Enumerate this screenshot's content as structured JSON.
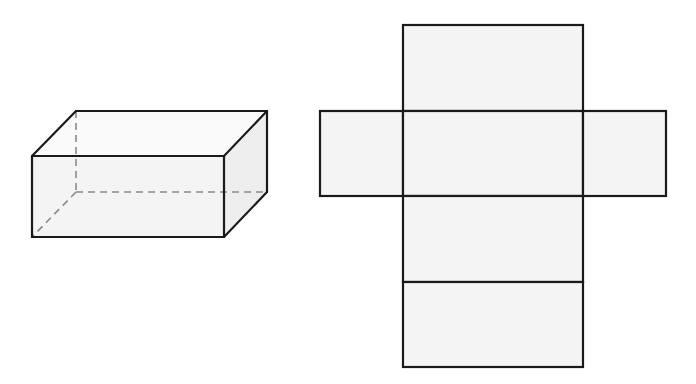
{
  "colors": {
    "background": "#ffffff",
    "edge": "#1a1a1a",
    "hidden_edge": "#8a8a8a",
    "face_fill": "#f4f4f4",
    "side_fill": "#eeeeee"
  },
  "figure": {
    "left": {
      "description": "Rectangular prism (cuboid) in oblique projection with hidden edges dashed",
      "vertices": {
        "front_top_left": [
          32,
          156
        ],
        "front_top_right": [
          224,
          156
        ],
        "front_bottom_left": [
          32,
          237
        ],
        "front_bottom_right": [
          224,
          237
        ],
        "back_top_left": [
          76,
          111
        ],
        "back_top_right": [
          267,
          111
        ],
        "back_bottom_right": [
          267,
          192
        ],
        "back_bottom_left_hidden": [
          76,
          192
        ]
      }
    },
    "right": {
      "description": "Net of the rectangular prism (cross-shaped unfolding, 6 faces)",
      "faces": [
        {
          "name": "top-face",
          "x": 403,
          "y": 25,
          "w": 180,
          "h": 86
        },
        {
          "name": "left-face",
          "x": 320,
          "y": 111,
          "w": 83,
          "h": 85
        },
        {
          "name": "center-face",
          "x": 403,
          "y": 111,
          "w": 180,
          "h": 85
        },
        {
          "name": "right-face",
          "x": 583,
          "y": 111,
          "w": 83,
          "h": 85
        },
        {
          "name": "lower-face",
          "x": 403,
          "y": 196,
          "w": 180,
          "h": 86
        },
        {
          "name": "bottom-face",
          "x": 403,
          "y": 282,
          "w": 180,
          "h": 85
        }
      ]
    }
  }
}
